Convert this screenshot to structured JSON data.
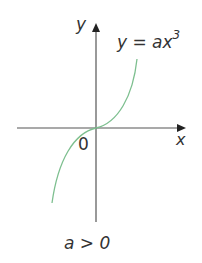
{
  "diagram": {
    "axes": {
      "x_label": "x",
      "y_label": "y",
      "origin_label": "0"
    },
    "curve": {
      "equation_lhs": "y = ax",
      "equation_exponent": "3",
      "color": "#7dbf8f"
    },
    "condition": "a > 0",
    "axis_color": "#555555"
  }
}
